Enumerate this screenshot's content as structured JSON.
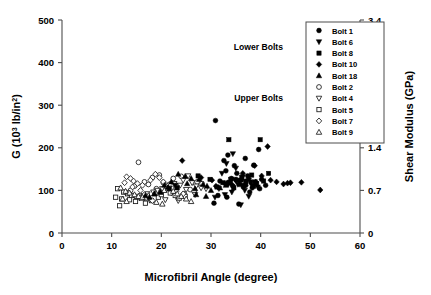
{
  "chart_data": {
    "type": "scatter",
    "title": "",
    "xlabel": "Microfibril Angle (degree)",
    "ylabel": "G (10^3 lb/in^2)",
    "ylabel_right": "Shear Modulus (GPa)",
    "xlim": [
      0,
      60
    ],
    "ylim": [
      0,
      500
    ],
    "ylim_right": [
      0,
      3.4
    ],
    "xticks": [
      0,
      10,
      20,
      30,
      40,
      50,
      60
    ],
    "yticks": [
      0,
      100,
      200,
      300,
      400,
      500
    ],
    "yticks_right": [
      "0",
      "0.7",
      "1.4",
      "2.1",
      "2.8",
      "3.4"
    ],
    "grid": false,
    "legend_position": "top-right",
    "annotations": [
      {
        "text": "Lower Bolts",
        "x": 44.5,
        "y": 430
      },
      {
        "text": "Upper Bolts",
        "x": 44.5,
        "y": 310
      }
    ],
    "series": [
      {
        "name": "Bolt 1",
        "marker": "circle",
        "fill": "filled",
        "group": "Lower Bolts",
        "points": [
          [
            30.9,
            264
          ],
          [
            33.4,
            183
          ],
          [
            32.6,
            170
          ],
          [
            34.7,
            158
          ],
          [
            39.6,
            196
          ],
          [
            36.9,
            175
          ],
          [
            38.6,
            159
          ],
          [
            33.0,
            146
          ],
          [
            35.2,
            140
          ],
          [
            37.4,
            134
          ],
          [
            34.1,
            128
          ],
          [
            36.1,
            124
          ],
          [
            38.0,
            120
          ],
          [
            33.8,
            118
          ],
          [
            35.8,
            114
          ],
          [
            37.0,
            112
          ],
          [
            39.0,
            118
          ],
          [
            40.2,
            126
          ],
          [
            31.8,
            122
          ],
          [
            32.9,
            116
          ],
          [
            34.4,
            110
          ],
          [
            36.5,
            108
          ],
          [
            38.3,
            106
          ],
          [
            30.6,
            70
          ],
          [
            35.6,
            68
          ],
          [
            31.4,
            88
          ],
          [
            33.2,
            84
          ],
          [
            37.8,
            96
          ],
          [
            39.8,
            104
          ],
          [
            41.0,
            112
          ]
        ]
      },
      {
        "name": "Bolt 6",
        "marker": "triangle-down",
        "fill": "filled",
        "group": "Lower Bolts",
        "points": [
          [
            34.4,
            186
          ],
          [
            33.1,
            163
          ],
          [
            35.0,
            152
          ],
          [
            32.2,
            140
          ],
          [
            36.4,
            132
          ],
          [
            34.8,
            126
          ],
          [
            37.2,
            122
          ],
          [
            33.6,
            118
          ],
          [
            35.4,
            114
          ],
          [
            38.2,
            112
          ],
          [
            31.6,
            104
          ],
          [
            36.8,
            100
          ],
          [
            34.2,
            96
          ],
          [
            32.8,
            90
          ],
          [
            37.6,
            86
          ],
          [
            38.8,
            120
          ],
          [
            30.8,
            84
          ],
          [
            39.4,
            108
          ],
          [
            36.0,
            66
          ],
          [
            22.8,
            112
          ]
        ]
      },
      {
        "name": "Bolt 8",
        "marker": "square",
        "fill": "filled",
        "group": "Lower Bolts",
        "points": [
          [
            33.6,
            219
          ],
          [
            39.9,
            219
          ],
          [
            41.6,
            140
          ],
          [
            38.2,
            136
          ],
          [
            36.2,
            130
          ],
          [
            34.0,
            126
          ],
          [
            35.4,
            124
          ],
          [
            37.0,
            120
          ],
          [
            32.4,
            118
          ],
          [
            33.2,
            114
          ],
          [
            36.6,
            112
          ],
          [
            38.6,
            110
          ],
          [
            31.2,
            108
          ],
          [
            34.6,
            106
          ],
          [
            39.2,
            116
          ],
          [
            40.6,
            122
          ],
          [
            23.2,
            106
          ],
          [
            27.4,
            134
          ],
          [
            29.8,
            126
          ],
          [
            21.6,
            104
          ]
        ]
      },
      {
        "name": "Bolt 10",
        "marker": "diamond",
        "fill": "filled",
        "group": "Lower Bolts",
        "points": [
          [
            41.4,
            203
          ],
          [
            24.2,
            170
          ],
          [
            38.8,
            158
          ],
          [
            36.4,
            140
          ],
          [
            40.2,
            134
          ],
          [
            37.6,
            128
          ],
          [
            35.0,
            124
          ],
          [
            39.0,
            120
          ],
          [
            33.4,
            118
          ],
          [
            42.0,
            124
          ],
          [
            44.6,
            115
          ],
          [
            45.4,
            117
          ],
          [
            46.0,
            118
          ],
          [
            48.2,
            119
          ],
          [
            52.0,
            101
          ],
          [
            28.0,
            130
          ],
          [
            30.2,
            124
          ],
          [
            34.2,
            114
          ],
          [
            31.0,
            110
          ],
          [
            43.2,
            120
          ]
        ]
      },
      {
        "name": "Bolt 18",
        "marker": "triangle-up",
        "fill": "filled",
        "group": "Lower Bolts",
        "points": [
          [
            23.4,
            138
          ],
          [
            24.8,
            133
          ],
          [
            26.0,
            128
          ],
          [
            27.6,
            126
          ],
          [
            22.0,
            120
          ],
          [
            25.2,
            116
          ],
          [
            28.4,
            114
          ],
          [
            20.6,
            112
          ],
          [
            29.2,
            110
          ],
          [
            21.4,
            108
          ],
          [
            26.8,
            104
          ],
          [
            19.8,
            96
          ],
          [
            27.0,
            90
          ],
          [
            18.6,
            92
          ],
          [
            30.0,
            100
          ],
          [
            31.8,
            106
          ],
          [
            33.0,
            112
          ],
          [
            16.8,
            88
          ],
          [
            17.6,
            84
          ],
          [
            29.0,
            86
          ]
        ]
      },
      {
        "name": "Bolt 2",
        "marker": "circle",
        "fill": "open",
        "group": "Upper Bolts",
        "points": [
          [
            15.4,
            166
          ],
          [
            19.6,
            136
          ],
          [
            18.2,
            130
          ],
          [
            24.0,
            133
          ],
          [
            22.4,
            128
          ],
          [
            16.6,
            120
          ],
          [
            20.4,
            118
          ],
          [
            17.4,
            114
          ],
          [
            21.2,
            112
          ],
          [
            14.6,
            110
          ],
          [
            23.0,
            108
          ],
          [
            19.0,
            104
          ],
          [
            25.8,
            102
          ],
          [
            13.8,
            100
          ],
          [
            26.6,
            98
          ],
          [
            12.8,
            96
          ],
          [
            24.6,
            92
          ],
          [
            27.2,
            120
          ],
          [
            28.2,
            116
          ],
          [
            15.8,
            88
          ]
        ]
      },
      {
        "name": "Bolt 4",
        "marker": "triangle-down",
        "fill": "open",
        "group": "Upper Bolts",
        "points": [
          [
            25.4,
            134
          ],
          [
            24.4,
            124
          ],
          [
            26.2,
            118
          ],
          [
            22.6,
            116
          ],
          [
            23.8,
            112
          ],
          [
            27.0,
            110
          ],
          [
            21.0,
            108
          ],
          [
            20.2,
            104
          ],
          [
            25.0,
            102
          ],
          [
            28.0,
            106
          ],
          [
            19.2,
            100
          ],
          [
            18.4,
            96
          ],
          [
            22.0,
            94
          ],
          [
            26.8,
            90
          ],
          [
            17.2,
            92
          ],
          [
            16.4,
            86
          ],
          [
            29.0,
            104
          ],
          [
            15.6,
            82
          ],
          [
            20.8,
            78
          ],
          [
            23.4,
            76
          ]
        ]
      },
      {
        "name": "Bolt 5",
        "marker": "square",
        "fill": "open",
        "group": "Upper Bolts",
        "points": [
          [
            11.2,
            104
          ],
          [
            12.4,
            96
          ],
          [
            13.2,
            92
          ],
          [
            14.0,
            88
          ],
          [
            10.8,
            84
          ],
          [
            15.0,
            86
          ],
          [
            16.0,
            82
          ],
          [
            12.0,
            80
          ],
          [
            13.6,
            78
          ],
          [
            17.0,
            80
          ],
          [
            18.0,
            76
          ],
          [
            14.8,
            74
          ],
          [
            19.4,
            84
          ],
          [
            20.0,
            90
          ],
          [
            21.8,
            94
          ],
          [
            11.6,
            64
          ],
          [
            22.8,
            88
          ],
          [
            16.8,
            70
          ],
          [
            23.6,
            82
          ],
          [
            24.8,
            86
          ]
        ]
      },
      {
        "name": "Bolt 7",
        "marker": "diamond",
        "fill": "open",
        "group": "Upper Bolts",
        "points": [
          [
            13.0,
            132
          ],
          [
            13.8,
            128
          ],
          [
            14.4,
            122
          ],
          [
            12.6,
            118
          ],
          [
            15.2,
            116
          ],
          [
            18.8,
            138
          ],
          [
            19.6,
            130
          ],
          [
            17.8,
            124
          ],
          [
            16.2,
            112
          ],
          [
            20.4,
            120
          ],
          [
            21.6,
            114
          ],
          [
            14.2,
            108
          ],
          [
            15.8,
            100
          ],
          [
            13.4,
            94
          ],
          [
            16.6,
            90
          ],
          [
            22.2,
            104
          ],
          [
            23.0,
            98
          ],
          [
            24.4,
            92
          ],
          [
            17.0,
            82
          ],
          [
            18.2,
            76
          ]
        ]
      },
      {
        "name": "Bolt 9",
        "marker": "triangle-up",
        "fill": "open",
        "group": "Upper Bolts",
        "points": [
          [
            11.8,
            106
          ],
          [
            12.8,
            98
          ],
          [
            13.6,
            94
          ],
          [
            14.6,
            90
          ],
          [
            15.4,
            86
          ],
          [
            16.2,
            84
          ],
          [
            17.4,
            88
          ],
          [
            18.6,
            92
          ],
          [
            19.8,
            96
          ],
          [
            20.6,
            100
          ],
          [
            21.4,
            104
          ],
          [
            22.4,
            98
          ],
          [
            23.2,
            92
          ],
          [
            24.0,
            86
          ],
          [
            25.0,
            80
          ],
          [
            12.2,
            80
          ],
          [
            13.0,
            74
          ],
          [
            19.0,
            72
          ],
          [
            20.2,
            68
          ],
          [
            26.0,
            74
          ]
        ]
      }
    ]
  },
  "legend": {
    "items": [
      {
        "label": "Bolt 1",
        "marker": "circle",
        "fill": "filled"
      },
      {
        "label": "Bolt 6",
        "marker": "triangle-down",
        "fill": "filled"
      },
      {
        "label": "Bolt 8",
        "marker": "square",
        "fill": "filled"
      },
      {
        "label": "Bolt 10",
        "marker": "diamond",
        "fill": "filled"
      },
      {
        "label": "Bolt 18",
        "marker": "triangle-up",
        "fill": "filled"
      },
      {
        "label": "Bolt 2",
        "marker": "circle",
        "fill": "open"
      },
      {
        "label": "Bolt 4",
        "marker": "triangle-down",
        "fill": "open"
      },
      {
        "label": "Bolt 5",
        "marker": "square",
        "fill": "open"
      },
      {
        "label": "Bolt 7",
        "marker": "diamond",
        "fill": "open"
      },
      {
        "label": "Bolt 9",
        "marker": "triangle-up",
        "fill": "open"
      }
    ]
  },
  "axis_title_parts": {
    "y_left_a": "G (10",
    "y_left_sup1": "3",
    "y_left_b": " lb/in",
    "y_left_sup2": "2",
    "y_left_c": ")"
  },
  "colors": {
    "marker": "#000000",
    "axis": "#4d4d4d",
    "background": "#ffffff"
  }
}
